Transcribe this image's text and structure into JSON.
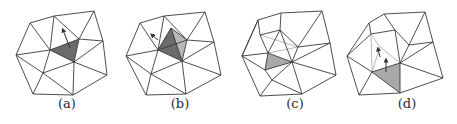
{
  "figure": {
    "colors": {
      "edge": "#3a3a3a",
      "dark_face": "#6b6b6b",
      "medium_face": "#8f8f8f",
      "light_face": "#b8b8b8",
      "grey_face": "#a9a9a9",
      "arrow": "#333333"
    },
    "panels": [
      {
        "id": "a",
        "caption": "(a)",
        "caption_x": 47,
        "vertices": {
          "TL": [
            30,
            23
          ],
          "TM": [
            54,
            16
          ],
          "TR": [
            94,
            11
          ],
          "R": [
            103,
            41
          ],
          "RL": [
            107,
            75
          ],
          "BR": [
            73,
            95
          ],
          "BL": [
            33,
            94
          ],
          "L": [
            16,
            55
          ],
          "C1": [
            50,
            50
          ],
          "C2": [
            79,
            39
          ],
          "C3": [
            74,
            62
          ],
          "LI": [
            43,
            73
          ]
        },
        "edges": [
          [
            "TL",
            "TM"
          ],
          [
            "TM",
            "TR"
          ],
          [
            "TR",
            "R"
          ],
          [
            "R",
            "RL"
          ],
          [
            "RL",
            "BR"
          ],
          [
            "BR",
            "BL"
          ],
          [
            "BL",
            "L"
          ],
          [
            "L",
            "TL"
          ],
          [
            "TL",
            "C1"
          ],
          [
            "TM",
            "C1"
          ],
          [
            "TM",
            "C2"
          ],
          [
            "TR",
            "C2"
          ],
          [
            "R",
            "C2"
          ],
          [
            "R",
            "C3"
          ],
          [
            "RL",
            "C3"
          ],
          [
            "BR",
            "C3"
          ],
          [
            "C1",
            "C2"
          ],
          [
            "C2",
            "C3"
          ],
          [
            "C3",
            "C1"
          ],
          [
            "L",
            "C1"
          ],
          [
            "L",
            "LI"
          ],
          [
            "C1",
            "LI"
          ],
          [
            "C3",
            "LI"
          ],
          [
            "BL",
            "LI"
          ],
          [
            "BR",
            "LI"
          ]
        ],
        "faces": [
          {
            "pts": [
              "C1",
              "C2",
              "C3"
            ],
            "shade": "dark_face"
          }
        ],
        "arrows": [
          {
            "from": [
              70,
              48
            ],
            "to": [
              63,
              30
            ]
          }
        ]
      },
      {
        "id": "b",
        "caption": "(b)",
        "caption_x": 160,
        "vertices": {
          "TL": [
            140,
            23
          ],
          "TM": [
            164,
            16
          ],
          "TR": [
            205,
            12
          ],
          "R": [
            214,
            42
          ],
          "RL": [
            221,
            75
          ],
          "BR": [
            186,
            94
          ],
          "BL": [
            146,
            95
          ],
          "L": [
            126,
            56
          ],
          "C1": [
            158,
            50
          ],
          "C2": [
            187,
            40
          ],
          "C3": [
            182,
            61
          ],
          "LI": [
            151,
            74
          ],
          "AP": [
            171,
            28
          ]
        },
        "edges": [
          [
            "TL",
            "TM"
          ],
          [
            "TM",
            "TR"
          ],
          [
            "TR",
            "R"
          ],
          [
            "R",
            "RL"
          ],
          [
            "RL",
            "BR"
          ],
          [
            "BR",
            "BL"
          ],
          [
            "BL",
            "L"
          ],
          [
            "L",
            "TL"
          ],
          [
            "TL",
            "C1"
          ],
          [
            "TM",
            "C1"
          ],
          [
            "TM",
            "C2"
          ],
          [
            "TR",
            "C2"
          ],
          [
            "R",
            "C2"
          ],
          [
            "R",
            "C3"
          ],
          [
            "RL",
            "C3"
          ],
          [
            "BR",
            "C3"
          ],
          [
            "C1",
            "C2"
          ],
          [
            "C2",
            "C3"
          ],
          [
            "C3",
            "C1"
          ],
          [
            "L",
            "C1"
          ],
          [
            "L",
            "LI"
          ],
          [
            "C1",
            "LI"
          ],
          [
            "C3",
            "LI"
          ],
          [
            "BL",
            "LI"
          ],
          [
            "BR",
            "LI"
          ],
          [
            "AP",
            "C1"
          ],
          [
            "AP",
            "C2"
          ],
          [
            "AP",
            "C3"
          ]
        ],
        "faces": [
          {
            "pts": [
              "C1",
              "AP",
              "C2"
            ],
            "shade": "light_face"
          },
          {
            "pts": [
              "AP",
              "C2",
              "C3"
            ],
            "shade": "light_face"
          },
          {
            "pts": [
              "C1",
              "AP",
              "C3"
            ],
            "shade": "dark_face"
          }
        ],
        "arrows": [
          {
            "from": [
              158,
              40
            ],
            "to": [
              152,
              35
            ]
          }
        ]
      },
      {
        "id": "c",
        "caption": "(c)",
        "caption_x": 275,
        "vertices": {
          "TL": [
            258,
            20
          ],
          "TM": [
            281,
            13
          ],
          "TR": [
            322,
            11
          ],
          "R": [
            330,
            43
          ],
          "RL": [
            336,
            75
          ],
          "BR": [
            302,
            94
          ],
          "BL": [
            260,
            96
          ],
          "L": [
            242,
            56
          ],
          "Q1": [
            260,
            35
          ],
          "Q2": [
            280,
            30
          ],
          "Q3": [
            298,
            47
          ],
          "Q4": [
            268,
            53
          ],
          "G2": [
            292,
            62
          ],
          "G3": [
            265,
            70
          ],
          "LI": [
            272,
            80
          ]
        },
        "edges": [
          [
            "TL",
            "TM"
          ],
          [
            "TM",
            "TR"
          ],
          [
            "TR",
            "R"
          ],
          [
            "R",
            "RL"
          ],
          [
            "RL",
            "BR"
          ],
          [
            "BR",
            "BL"
          ],
          [
            "BL",
            "L"
          ],
          [
            "L",
            "TL"
          ],
          [
            "TL",
            "Q1"
          ],
          [
            "TM",
            "Q2"
          ],
          [
            "TR",
            "Q3"
          ],
          [
            "R",
            "Q3"
          ],
          [
            "R",
            "G2"
          ],
          [
            "RL",
            "G2"
          ],
          [
            "BR",
            "G2"
          ],
          [
            "Q1",
            "Q2"
          ],
          [
            "Q2",
            "Q3"
          ],
          [
            "Q1",
            "Q4"
          ],
          [
            "Q2",
            "Q4"
          ],
          [
            "Q3",
            "G2"
          ],
          [
            "Q2",
            "G2"
          ],
          [
            "Q4",
            "G2"
          ],
          [
            "G2",
            "G3"
          ],
          [
            "G3",
            "Q4"
          ],
          [
            "L",
            "Q4"
          ],
          [
            "L",
            "G3"
          ],
          [
            "G3",
            "LI"
          ],
          [
            "G2",
            "LI"
          ],
          [
            "BL",
            "LI"
          ],
          [
            "BR",
            "LI"
          ],
          [
            "L",
            "TL"
          ]
        ],
        "faces": [
          {
            "pts": [
              "Q4",
              "G2",
              "G3"
            ],
            "shade": "grey_face"
          }
        ],
        "thin_edges": [
          [
            "Q1",
            "Q3"
          ],
          [
            "Q4",
            "Q3"
          ]
        ],
        "arrows": []
      },
      {
        "id": "d",
        "caption": "(d)",
        "caption_x": 387,
        "vertices": {
          "TL": [
            369,
            23
          ],
          "TM": [
            384,
            14
          ],
          "TR": [
            425,
            12
          ],
          "R": [
            433,
            42
          ],
          "RL": [
            443,
            78
          ],
          "BR": [
            400,
            93
          ],
          "BL": [
            359,
            95
          ],
          "L": [
            347,
            56
          ],
          "Q1": [
            371,
            34
          ],
          "Q2": [
            395,
            30
          ],
          "Q3": [
            409,
            45
          ],
          "Q4": [
            380,
            47
          ],
          "G1": [
            372,
            72
          ],
          "G2": [
            400,
            63
          ],
          "G3": [
            400,
            92
          ]
        },
        "edges": [
          [
            "TL",
            "TM"
          ],
          [
            "TM",
            "TR"
          ],
          [
            "TR",
            "R"
          ],
          [
            "R",
            "RL"
          ],
          [
            "RL",
            "BR"
          ],
          [
            "BR",
            "BL"
          ],
          [
            "BL",
            "L"
          ],
          [
            "L",
            "TL"
          ],
          [
            "TL",
            "Q1"
          ],
          [
            "TM",
            "Q2"
          ],
          [
            "TR",
            "Q3"
          ],
          [
            "R",
            "Q3"
          ],
          [
            "R",
            "G2"
          ],
          [
            "RL",
            "G2"
          ],
          [
            "Q1",
            "Q2"
          ],
          [
            "Q2",
            "Q3"
          ],
          [
            "Q3",
            "G2"
          ],
          [
            "Q2",
            "G2"
          ],
          [
            "G1",
            "G2"
          ],
          [
            "G2",
            "BR"
          ],
          [
            "G1",
            "BR"
          ],
          [
            "L",
            "G1"
          ],
          [
            "BL",
            "G1"
          ],
          [
            "L",
            "Q1"
          ]
        ],
        "faces": [
          {
            "pts": [
              "G1",
              "G2",
              "BR"
            ],
            "shade": "grey_face"
          }
        ],
        "thin_edges": [
          [
            "Q1",
            "G1"
          ],
          [
            "Q4",
            "G1"
          ],
          [
            "Q4",
            "G2"
          ],
          [
            "Q1",
            "Q4"
          ]
        ],
        "arrows": [
          {
            "from": [
              386,
              72
            ],
            "to": [
              386,
              60
            ]
          },
          {
            "from": [
              380,
              57
            ],
            "to": [
              378,
              49
            ]
          }
        ]
      }
    ]
  }
}
